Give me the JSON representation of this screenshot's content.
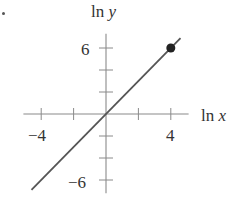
{
  "chart_data": {
    "type": "line",
    "title": "",
    "xlabel": "ln x",
    "ylabel": "ln y",
    "xlabel_parts": {
      "fn": "ln",
      "var": "x"
    },
    "ylabel_parts": {
      "fn": "ln",
      "var": "y"
    },
    "x_ticks": [
      -4,
      -2,
      2,
      4
    ],
    "y_ticks": [
      -6,
      -4,
      -2,
      2,
      4,
      6
    ],
    "x_tick_labels": [
      {
        "value": -4,
        "text": "−4"
      },
      {
        "value": 4,
        "text": "4"
      }
    ],
    "y_tick_labels": [
      {
        "value": 6,
        "text": "6"
      },
      {
        "value": -6,
        "text": "−6"
      }
    ],
    "xlim": [
      -5.1,
      5.1
    ],
    "ylim": [
      -7.2,
      7.3
    ],
    "grid": false,
    "legend": null,
    "series": [
      {
        "name": "ln y = 1.5 ln x",
        "x": [
          -4.6,
          4.6
        ],
        "y": [
          -6.9,
          6.9
        ],
        "color": "#555555"
      }
    ],
    "highlighted_points": [
      {
        "x": 4,
        "y": 6,
        "color": "#222222"
      }
    ]
  }
}
